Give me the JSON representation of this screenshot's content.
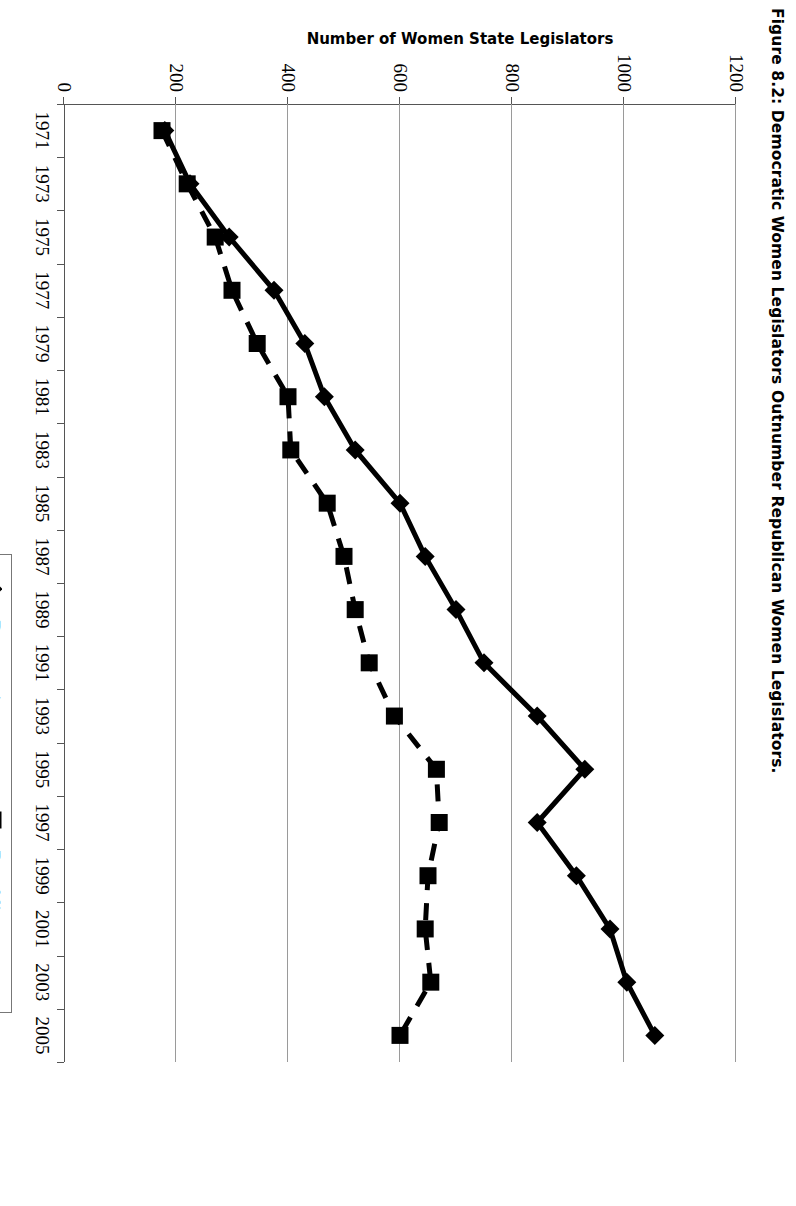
{
  "figure": {
    "title": "Figure 8.2:  Democratic Women Legislators Outnumber Republican Women Legislators."
  },
  "legend": {
    "position": "bottom-right",
    "items": [
      {
        "label": "Democratic women",
        "marker": "diamond-marker",
        "line": "solid"
      },
      {
        "label": "Republican women",
        "marker": "square-marker",
        "line": "dashed"
      }
    ]
  },
  "axes": {
    "x_title": "",
    "y_title": "Number of Women State Legislators",
    "x_tick_labels": [
      "1971",
      "1973",
      "1975",
      "1977",
      "1979",
      "1981",
      "1983",
      "1985",
      "1987",
      "1989",
      "1991",
      "1993",
      "1995",
      "1997",
      "1999",
      "2001",
      "2003",
      "2005"
    ],
    "y_tick_labels": [
      "0",
      "200",
      "400",
      "600",
      "800",
      "1000",
      "1200"
    ]
  },
  "chart_data": {
    "type": "line",
    "title": "Figure 8.2:  Democratic Women Legislators Outnumber Republican Women Legislators.",
    "xlabel": "",
    "ylabel": "Number of Women State Legislators",
    "ylim": [
      0,
      1200
    ],
    "yticks": [
      0,
      200,
      400,
      600,
      800,
      1000,
      1200
    ],
    "grid": "horizontal-value-gridlines",
    "legend_position": "bottom-right",
    "x": [
      1971,
      1973,
      1975,
      1977,
      1979,
      1981,
      1983,
      1985,
      1987,
      1989,
      1991,
      1993,
      1995,
      1997,
      1999,
      2001,
      2003,
      2005
    ],
    "series": [
      {
        "name": "Democratic women",
        "marker": "diamond",
        "line": "solid",
        "values": [
          180,
          225,
          295,
          375,
          430,
          465,
          520,
          600,
          645,
          700,
          750,
          845,
          930,
          845,
          915,
          975,
          1005,
          1055
        ]
      },
      {
        "name": "Republican women",
        "marker": "square",
        "line": "dashed",
        "values": [
          175,
          220,
          270,
          300,
          345,
          400,
          405,
          470,
          500,
          520,
          545,
          590,
          665,
          670,
          650,
          645,
          655,
          600
        ]
      }
    ]
  }
}
